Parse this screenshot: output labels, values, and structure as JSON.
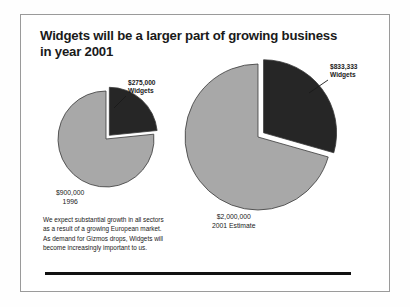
{
  "slide": {
    "title_lines": [
      "Widgets will be a larger part of growing business",
      "in year 2001"
    ],
    "body_lines": [
      "We expect substantial growth in all sectors",
      "as a result of a growing European market.",
      "As demand for Gizmos drops, Widgets will",
      "become increasingly important to us."
    ],
    "rule_color": "#111111",
    "frame_color": "#9a9a9a"
  },
  "chart_data": [
    {
      "type": "pie",
      "name": "1996 revenue mix",
      "title": "",
      "categories": [
        "Widgets",
        "Gizmos"
      ],
      "values": [
        275000,
        900000
      ],
      "value_labels": [
        "$275,000",
        "$900,000"
      ],
      "colors": [
        "#262626",
        "#a8a8a8"
      ],
      "exploded": [
        true,
        false
      ],
      "start_angle_deg": 0,
      "total": 1175000,
      "callout": {
        "line1": "$275,000",
        "line2": "Widgets"
      },
      "caption": {
        "line1": "$900,000",
        "line2": "1996"
      }
    },
    {
      "type": "pie",
      "name": "2001 estimate revenue mix",
      "title": "",
      "categories": [
        "Widgets",
        "Gizmos"
      ],
      "values": [
        833333,
        2000000
      ],
      "value_labels": [
        "$833,333",
        "$2,000,000"
      ],
      "colors": [
        "#262626",
        "#a8a8a8"
      ],
      "exploded": [
        true,
        false
      ],
      "start_angle_deg": 0,
      "total": 2833333,
      "callout": {
        "line1": "$833,333",
        "line2": "Widgets"
      },
      "caption": {
        "line1": "$2,000,000",
        "line2": "2001 Estimate"
      }
    }
  ],
  "geometry": {
    "pies": [
      {
        "cx": 106,
        "cy": 139,
        "r": 48,
        "explode_offset": 5
      },
      {
        "cx": 258,
        "cy": 137,
        "r": 73,
        "explode_offset": 7
      }
    ],
    "callout_positions": [
      {
        "left": 128,
        "top": 79
      },
      {
        "left": 330,
        "top": 63
      }
    ],
    "caption_positions": [
      {
        "left": 56,
        "top": 188
      },
      {
        "left": 212,
        "top": 212
      }
    ],
    "leader_lines": [
      {
        "x1": 126,
        "y1": 96,
        "x2": 114,
        "y2": 108
      },
      {
        "x1": 328,
        "y1": 80,
        "x2": 309,
        "y2": 93
      }
    ]
  }
}
